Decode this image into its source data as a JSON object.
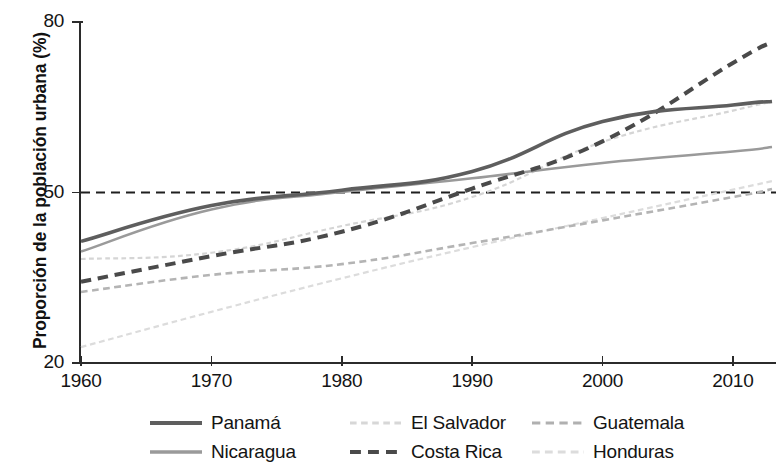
{
  "chart_data": {
    "type": "line",
    "title": "",
    "xlabel": "",
    "ylabel": "Proporción de la población urbana (%)",
    "xlim": [
      1960,
      2013
    ],
    "ylim": [
      20,
      80
    ],
    "yticks": [
      20,
      50,
      80
    ],
    "xticks": [
      1960,
      1970,
      1980,
      1990,
      2000,
      2010
    ],
    "grid": false,
    "legend_position": "bottom",
    "reference_line": {
      "value": 50,
      "style": "dashed",
      "color": "#1f1f1f"
    },
    "x": [
      1960,
      1970,
      1980,
      1990,
      2000,
      2010,
      2013
    ],
    "series": [
      {
        "name": "Panamá",
        "style": "solid",
        "width": 3.6,
        "color": "#5e5e5e",
        "values": [
          41.4,
          47.7,
          50.4,
          53.7,
          62.5,
          65.4,
          66.0
        ]
      },
      {
        "name": "Nicaragua",
        "style": "solid",
        "width": 2.6,
        "color": "#9a9a9a",
        "values": [
          39.6,
          47.0,
          50.1,
          52.5,
          55.2,
          57.2,
          58.0
        ]
      },
      {
        "name": "El Salvador",
        "style": "dotted",
        "width": 2.2,
        "color": "#d5d5d5",
        "values": [
          38.3,
          39.4,
          44.1,
          49.2,
          58.9,
          64.4,
          66.0
        ]
      },
      {
        "name": "Costa Rica",
        "style": "dashed",
        "width": 4.0,
        "color": "#4a4a4a",
        "values": [
          34.3,
          38.8,
          43.1,
          50.7,
          59.0,
          72.8,
          76.5
        ]
      },
      {
        "name": "Guatemala",
        "style": "dashed",
        "width": 2.6,
        "color": "#b4b4b4",
        "values": [
          32.5,
          35.5,
          37.4,
          41.1,
          45.1,
          49.2,
          50.6
        ]
      },
      {
        "name": "Honduras",
        "style": "dashed",
        "width": 2.2,
        "color": "#dcdcdc",
        "values": [
          22.8,
          29.0,
          34.9,
          40.4,
          45.5,
          50.5,
          52.0
        ]
      }
    ]
  },
  "axis": {
    "y_tick_labels": [
      "80",
      "50",
      "20"
    ],
    "x_tick_labels": [
      "1960",
      "1970",
      "1980",
      "1990",
      "2000",
      "2010"
    ],
    "y_title": "Proporción de la población urbana (%)"
  },
  "legend": {
    "items": [
      {
        "label": "Panamá",
        "style": "solid",
        "color": "#5e5e5e",
        "width": 4.2
      },
      {
        "label": "El Salvador",
        "style": "dotted",
        "color": "#d7d7d7",
        "width": 3.0
      },
      {
        "label": "Guatemala",
        "style": "dashed",
        "color": "#b0b0b0",
        "width": 3.2
      },
      {
        "label": "Nicaragua",
        "style": "solid",
        "color": "#9a9a9a",
        "width": 3.4
      },
      {
        "label": "Costa Rica",
        "style": "dashed",
        "color": "#4a4a4a",
        "width": 4.2
      },
      {
        "label": "Honduras",
        "style": "dashed",
        "color": "#dcdcdc",
        "width": 3.0
      }
    ]
  }
}
